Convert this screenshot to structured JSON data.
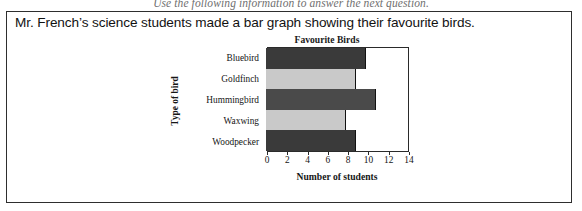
{
  "instruction": "Use the following information to answer the next question.",
  "question_text": "Mr. French’s science students made a bar graph showing their favourite birds.",
  "chart_data": {
    "type": "bar",
    "orientation": "horizontal",
    "title": "Favourite Birds",
    "xlabel": "Number of students",
    "ylabel": "Type of bird",
    "categories": [
      "Bluebird",
      "Goldfinch",
      "Hummingbird",
      "Waxwing",
      "Woodpecker"
    ],
    "values": [
      10,
      9,
      11,
      8,
      9
    ],
    "colors": [
      "#3a3a3a",
      "#c9c9c9",
      "#4a4a4a",
      "#c9c9c9",
      "#3a3a3a"
    ],
    "xlim": [
      0,
      14
    ],
    "xticks": [
      0,
      2,
      4,
      6,
      8,
      10,
      12,
      14
    ],
    "xtick_labels": [
      "0",
      "2",
      "4",
      "6",
      "8",
      "10",
      "12",
      "14"
    ],
    "grid": false,
    "legend": false
  }
}
